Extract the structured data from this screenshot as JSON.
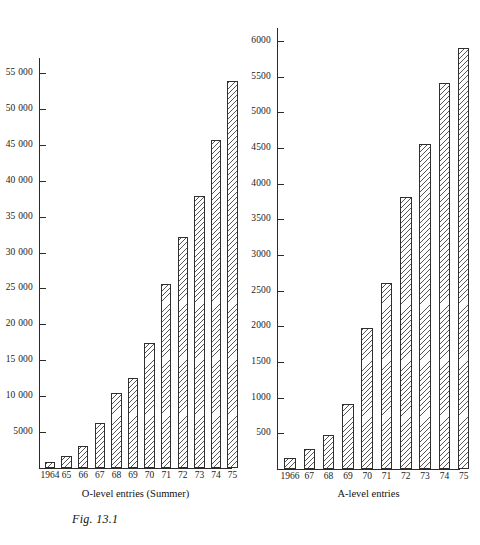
{
  "figure": {
    "caption": "Fig. 13.1"
  },
  "chart_data": [
    {
      "type": "bar",
      "title": "",
      "xlabel": "O-level entries (Summer)",
      "ylabel": "",
      "categories": [
        "1964",
        "65",
        "66",
        "67",
        "68",
        "69",
        "70",
        "71",
        "72",
        "73",
        "74",
        "75"
      ],
      "values": [
        900,
        1700,
        3100,
        6300,
        10400,
        12500,
        17400,
        25600,
        32200,
        37900,
        45700,
        53900
      ],
      "ylim": [
        0,
        57000
      ],
      "yticks": [
        5000,
        10000,
        15000,
        20000,
        25000,
        30000,
        35000,
        40000,
        45000,
        50000,
        55000
      ],
      "ytick_labels": [
        "5000",
        "10 000",
        "15 000",
        "20 000",
        "25 000",
        "30 000",
        "35 000",
        "40 000",
        "45 000",
        "50 000",
        "55 000"
      ],
      "grid": false,
      "legend": "none"
    },
    {
      "type": "bar",
      "title": "",
      "xlabel": "A-level entries",
      "ylabel": "",
      "categories": [
        "1966",
        "67",
        "68",
        "69",
        "70",
        "71",
        "72",
        "73",
        "74",
        "75"
      ],
      "values": [
        150,
        280,
        470,
        910,
        1970,
        2610,
        3810,
        4560,
        5410,
        5900
      ],
      "ylim": [
        0,
        6200
      ],
      "yticks": [
        500,
        1000,
        1500,
        2000,
        2500,
        3000,
        3500,
        4000,
        4500,
        5000,
        5500,
        6000
      ],
      "ytick_labels": [
        "500",
        "1000",
        "1500",
        "2000",
        "2500",
        "3000",
        "3500",
        "4000",
        "4500",
        "5000",
        "5500",
        "6000"
      ],
      "grid": false,
      "legend": "none"
    }
  ]
}
